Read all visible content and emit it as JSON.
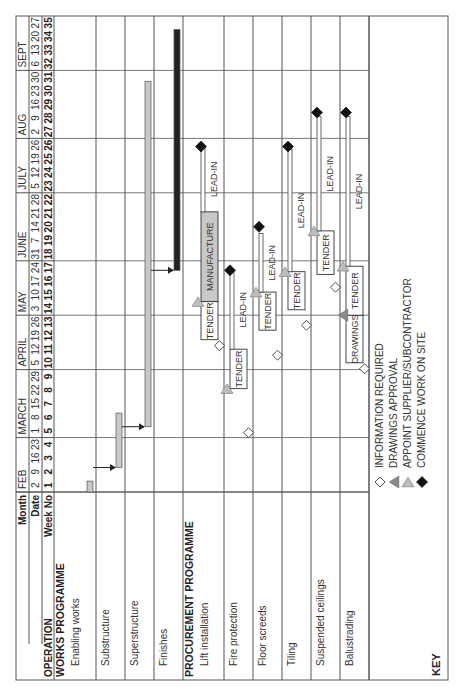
{
  "chart_data": {
    "type": "gantt",
    "title": "",
    "header": {
      "month_label": "Month",
      "date_label": "Date",
      "week_label": "Week No",
      "operation_label": "OPERATION",
      "months": [
        {
          "name": "FEB",
          "start_week": 1,
          "end_week": 4
        },
        {
          "name": "MARCH",
          "start_week": 5,
          "end_week": 9
        },
        {
          "name": "APRIL",
          "start_week": 10,
          "end_week": 13
        },
        {
          "name": "MAY",
          "start_week": 14,
          "end_week": 17
        },
        {
          "name": "JUNE",
          "start_week": 18,
          "end_week": 22
        },
        {
          "name": "JULY",
          "start_week": 23,
          "end_week": 26
        },
        {
          "name": "AUG",
          "start_week": 27,
          "end_week": 31
        },
        {
          "name": "SEPT",
          "start_week": 32,
          "end_week": 35
        }
      ],
      "dates": [
        "2",
        "9",
        "16",
        "23",
        "1",
        "8",
        "15",
        "22",
        "29",
        "5",
        "12",
        "19",
        "26",
        "3",
        "10",
        "17",
        "24",
        "31",
        "7",
        "14",
        "21",
        "28",
        "5",
        "12",
        "19",
        "26",
        "2",
        "9",
        "16",
        "23",
        "30",
        "6",
        "13",
        "20",
        "27"
      ],
      "weeks": [
        "1",
        "2",
        "3",
        "4",
        "5",
        "6",
        "7",
        "8",
        "9",
        "10",
        "11",
        "12",
        "13",
        "14",
        "15",
        "16",
        "17",
        "18",
        "19",
        "20",
        "21",
        "22",
        "23",
        "24",
        "25",
        "26",
        "27",
        "28",
        "29",
        "30",
        "31",
        "32",
        "33",
        "34",
        "35"
      ]
    },
    "sections": [
      {
        "name": "WORKS PROGRAMME",
        "rows": [
          {
            "label": "Enabling works",
            "bars": [
              {
                "start": 1,
                "end": 1.8,
                "style": "grey"
              }
            ]
          },
          {
            "label": "Substructure",
            "bars": [
              {
                "start": 2.8,
                "end": 6.8,
                "style": "grey"
              }
            ]
          },
          {
            "label": "Superstructure",
            "bars": [
              {
                "start": 5.8,
                "end": 31.2,
                "style": "grey"
              }
            ]
          },
          {
            "label": "Finishes",
            "bars": [
              {
                "start": 17.3,
                "end": 35,
                "style": "black"
              }
            ]
          }
        ],
        "links": [
          {
            "from_row": 0,
            "to_row": 1,
            "at_week": 2.8
          },
          {
            "from_row": 1,
            "to_row": 2,
            "at_week": 5.8
          },
          {
            "from_row": 2,
            "to_row": 3,
            "at_week": 17.3
          }
        ]
      },
      {
        "name": "PROCUREMENT PROGRAMME",
        "rows": [
          {
            "label": "Lift installation",
            "phases": [
              {
                "name": "TENDER",
                "start": 12.2,
                "end": 15.0
              },
              {
                "name": "MANUFACTURE",
                "start": 15.0,
                "end": 21.6,
                "style": "grey"
              },
              {
                "name": "LEAD-IN",
                "start": 21.6,
                "end": 26.4,
                "style": "thin"
              }
            ],
            "milestones": [
              {
                "type": "information-required",
                "week": 12.2
              },
              {
                "type": "appoint-supplier",
                "week": 15.0
              },
              {
                "type": "commence-on-site",
                "week": 26.4
              }
            ]
          },
          {
            "label": "Fire protection",
            "phases": [
              {
                "name": "TENDER",
                "start": 8.6,
                "end": 11.5
              },
              {
                "name": "LEAD-IN",
                "start": 11.5,
                "end": 17.3,
                "style": "thin"
              }
            ],
            "milestones": [
              {
                "type": "information-required",
                "week": 5.8
              },
              {
                "type": "appoint-supplier",
                "week": 8.6
              },
              {
                "type": "commence-on-site",
                "week": 17.3
              }
            ]
          },
          {
            "label": "Floor screeds",
            "phases": [
              {
                "name": "TENDER",
                "start": 12.9,
                "end": 15.7
              },
              {
                "name": "LEAD-IN",
                "start": 15.7,
                "end": 20.0,
                "style": "thin"
              }
            ],
            "milestones": [
              {
                "type": "information-required",
                "week": 11.5
              },
              {
                "type": "appoint-supplier",
                "week": 15.7
              },
              {
                "type": "commence-on-site",
                "week": 20.5
              }
            ]
          },
          {
            "label": "Tiling",
            "phases": [
              {
                "name": "TENDER",
                "start": 14.4,
                "end": 17.2
              },
              {
                "name": "LEAD-IN",
                "start": 17.2,
                "end": 26.2,
                "style": "thin"
              }
            ],
            "milestones": [
              {
                "type": "information-required",
                "week": 13.7
              },
              {
                "type": "appoint-supplier",
                "week": 17.2
              },
              {
                "type": "commence-on-site",
                "week": 26.4
              }
            ]
          },
          {
            "label": "Suspended ceilings",
            "phases": [
              {
                "name": "TENDER",
                "start": 17.0,
                "end": 20.2
              },
              {
                "name": "LEAD-IN",
                "start": 20.2,
                "end": 28.6,
                "style": "thin"
              }
            ],
            "milestones": [
              {
                "type": "information-required",
                "week": 16.5
              },
              {
                "type": "appoint-supplier",
                "week": 20.2
              },
              {
                "type": "commence-on-site",
                "week": 28.9
              }
            ]
          },
          {
            "label": "Balustrading",
            "phases": [
              {
                "name": "DRAWINGS",
                "start": 10.5,
                "end": 14.0
              },
              {
                "name": "TENDER",
                "start": 14.0,
                "end": 17.6
              },
              {
                "name": "LEAD-IN",
                "start": 17.6,
                "end": 28.6,
                "style": "thin"
              }
            ],
            "milestones": [
              {
                "type": "information-required",
                "week": 10.5
              },
              {
                "type": "drawings-approval",
                "week": 14.0
              },
              {
                "type": "appoint-supplier",
                "week": 17.6
              },
              {
                "type": "commence-on-site",
                "week": 28.9
              }
            ]
          }
        ]
      }
    ],
    "key": {
      "title": "KEY",
      "items": [
        {
          "symbol": "information-required",
          "label": "INFORMATION REQUIRED"
        },
        {
          "symbol": "drawings-approval",
          "label": "DRAWINGS APPROVAL"
        },
        {
          "symbol": "appoint-supplier",
          "label": "APPOINT SUPPLIER/SUBCONTRACTOR"
        },
        {
          "symbol": "commence-on-site",
          "label": "COMMENCE WORK ON SITE"
        }
      ]
    },
    "colors": {
      "grid": "#555555",
      "grey_bar": "#c8c8c8",
      "black_bar": "#222222",
      "drawings_triangle": "#8a8a8a",
      "supplier_triangle": "#bdbdbd"
    }
  }
}
